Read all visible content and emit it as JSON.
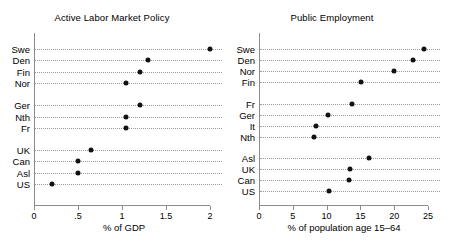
{
  "chart_data": [
    {
      "type": "scatter",
      "title": "Active Labor Market Policy",
      "xlabel": "% of GDP",
      "ylabel": "",
      "xlim": [
        0,
        2
      ],
      "grid": true,
      "legend": "none",
      "orientation": "horizontal-dot",
      "xticks": [
        0,
        0.5,
        1,
        1.5,
        2
      ],
      "xtick_labels": [
        "0",
        ".5",
        "1",
        "1.5",
        "2"
      ],
      "groups": [
        {
          "categories": [
            "Swe",
            "Den",
            "Fin",
            "Nor"
          ],
          "values": [
            2.0,
            1.3,
            1.2,
            1.05
          ]
        },
        {
          "categories": [
            "Ger",
            "Nth",
            "Fr"
          ],
          "values": [
            1.2,
            1.05,
            1.05
          ]
        },
        {
          "categories": [
            "UK",
            "Can",
            "Asl",
            "US"
          ],
          "values": [
            0.65,
            0.5,
            0.5,
            0.2
          ]
        }
      ]
    },
    {
      "type": "scatter",
      "title": "Public Employment",
      "xlabel": "% of population age 15–64",
      "ylabel": "",
      "xlim": [
        0,
        25
      ],
      "grid": true,
      "legend": "none",
      "orientation": "horizontal-dot",
      "xticks": [
        0,
        5,
        10,
        15,
        20,
        25
      ],
      "xtick_labels": [
        "0",
        "5",
        "10",
        "15",
        "20",
        "25"
      ],
      "groups": [
        {
          "categories": [
            "Swe",
            "Den",
            "Nor",
            "Fin"
          ],
          "values": [
            24.4,
            22.8,
            19.9,
            15.1
          ]
        },
        {
          "categories": [
            "Fr",
            "Ger",
            "It",
            "Nth"
          ],
          "values": [
            13.8,
            10.2,
            8.5,
            8.2
          ]
        },
        {
          "categories": [
            "Asl",
            "UK",
            "Can",
            "US"
          ],
          "values": [
            16.2,
            13.5,
            13.3,
            10.3
          ]
        }
      ]
    }
  ],
  "colors": {
    "dot": "#111111",
    "axis": "#8c8c8c",
    "gridline": "#9a9a9a",
    "background": "#ffffff",
    "text": "#000000"
  }
}
